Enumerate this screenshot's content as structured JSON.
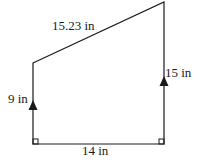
{
  "figure": {
    "shape": "right trapezoid",
    "labels": {
      "top_slant": "15.23 in",
      "left_side": "9 in",
      "right_side": "15 in",
      "bottom": "14 in"
    },
    "markers": {
      "right_angles": [
        "bottom-left",
        "bottom-right"
      ],
      "parallel_arrows": [
        "left_side",
        "right_side"
      ]
    },
    "colors": {
      "stroke": "#1a1a1a",
      "background": "#ffffff"
    }
  }
}
